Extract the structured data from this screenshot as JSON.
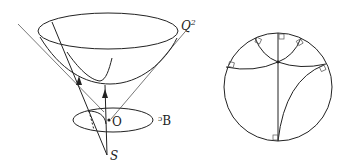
{
  "figure": {
    "left_panel": {
      "description": "Hyperboloid sheet Q^2 inside light cone, projected from S onto disk D through origin O",
      "labels": {
        "surface": "Q",
        "surface_superscript": "2",
        "origin": "O",
        "disk": "ᵓB",
        "projection_point": "S"
      }
    },
    "right_panel": {
      "description": "Poincaré disk with hyperbolic geodesics meeting boundary at right angles",
      "right_angle_markers": 6
    },
    "colors": {
      "stroke": "#222222",
      "background": "#ffffff"
    }
  }
}
